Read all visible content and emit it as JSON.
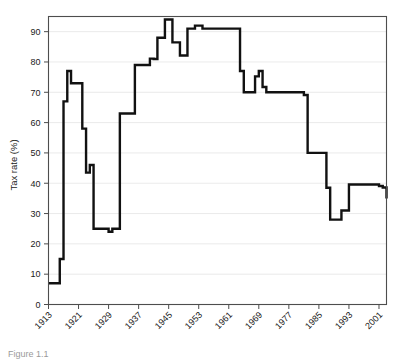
{
  "figure": {
    "caption": "Figure 1.1"
  },
  "chart_data": {
    "type": "line",
    "title": "",
    "xlabel": "",
    "ylabel": "Tax rate (%)",
    "xlim": [
      1913,
      2003
    ],
    "ylim": [
      0,
      95
    ],
    "grid": true,
    "legend": "none",
    "y_ticks": [
      0,
      10,
      20,
      30,
      40,
      50,
      60,
      70,
      80,
      90
    ],
    "x_ticks": [
      1913,
      1921,
      1929,
      1937,
      1945,
      1953,
      1961,
      1969,
      1977,
      1985,
      1993,
      2001
    ],
    "x_tick_labels": [
      "1913",
      "1921",
      "1929",
      "1937",
      "1945",
      "1953",
      "1961",
      "1969",
      "1977",
      "1985",
      "1993",
      "2001"
    ],
    "y_tick_labels": [
      "0",
      "10",
      "20",
      "30",
      "40",
      "50",
      "60",
      "70",
      "80",
      "90"
    ],
    "line_color": "#111111",
    "series": [
      {
        "name": "Top marginal tax rate",
        "x": [
          1913,
          1914,
          1915,
          1916,
          1917,
          1918,
          1919,
          1920,
          1921,
          1922,
          1923,
          1924,
          1925,
          1926,
          1927,
          1928,
          1929,
          1930,
          1931,
          1932,
          1933,
          1934,
          1935,
          1936,
          1937,
          1938,
          1939,
          1940,
          1941,
          1942,
          1943,
          1944,
          1945,
          1946,
          1947,
          1948,
          1949,
          1950,
          1951,
          1952,
          1953,
          1954,
          1955,
          1956,
          1957,
          1958,
          1959,
          1960,
          1961,
          1962,
          1963,
          1964,
          1965,
          1966,
          1967,
          1968,
          1969,
          1970,
          1971,
          1972,
          1973,
          1974,
          1975,
          1976,
          1977,
          1978,
          1979,
          1980,
          1981,
          1982,
          1983,
          1984,
          1985,
          1986,
          1987,
          1988,
          1989,
          1990,
          1991,
          1992,
          1993,
          1994,
          1995,
          1996,
          1997,
          1998,
          1999,
          2000,
          2001,
          2002,
          2003
        ],
        "values": [
          7,
          7,
          7,
          15,
          67,
          77,
          73,
          73,
          73,
          58,
          43.5,
          46,
          25,
          25,
          25,
          25,
          24,
          25,
          25,
          63,
          63,
          63,
          63,
          79,
          79,
          79,
          79,
          81.1,
          81,
          88,
          88,
          94,
          94,
          86.45,
          86.45,
          82.13,
          82.13,
          91,
          91,
          92,
          92,
          91,
          91,
          91,
          91,
          91,
          91,
          91,
          91,
          91,
          91,
          77,
          70,
          70,
          70,
          75.25,
          77,
          71.75,
          70,
          70,
          70,
          70,
          70,
          70,
          70,
          70,
          70,
          70,
          69.125,
          50,
          50,
          50,
          50,
          50,
          38.5,
          28,
          28,
          28,
          31,
          31,
          39.6,
          39.6,
          39.6,
          39.6,
          39.6,
          39.6,
          39.6,
          39.6,
          39.1,
          38.6,
          35
        ]
      }
    ]
  }
}
